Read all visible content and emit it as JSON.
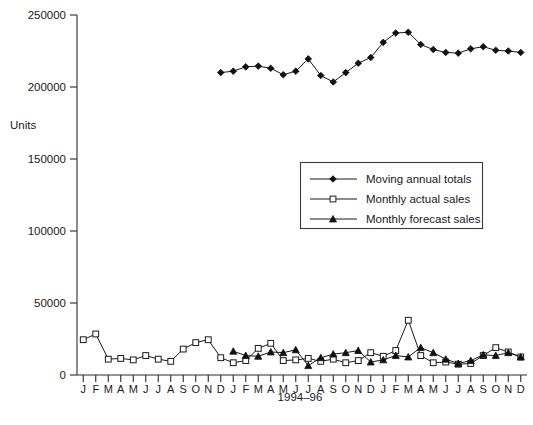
{
  "chart_data": {
    "type": "line",
    "title": "",
    "xlabel": "1994–96",
    "ylabel": "Units",
    "ylim": [
      0,
      250000
    ],
    "yticks": [
      0,
      50000,
      100000,
      150000,
      200000,
      250000
    ],
    "ytick_labels": [
      "0",
      "50000",
      "100000",
      "150000",
      "200000",
      "250000"
    ],
    "grid": false,
    "legend_position": "center-right",
    "categories": [
      "J",
      "F",
      "M",
      "A",
      "M",
      "J",
      "J",
      "A",
      "S",
      "O",
      "N",
      "D",
      "J",
      "F",
      "M",
      "A",
      "M",
      "J",
      "J",
      "A",
      "S",
      "O",
      "N",
      "D",
      "J",
      "F",
      "M",
      "A",
      "M",
      "J",
      "J",
      "A",
      "S",
      "O",
      "N",
      "D"
    ],
    "x_index": [
      1,
      2,
      3,
      4,
      5,
      6,
      7,
      8,
      9,
      10,
      11,
      12,
      13,
      14,
      15,
      16,
      17,
      18,
      19,
      20,
      21,
      22,
      23,
      24,
      25,
      26,
      27,
      28,
      29,
      30,
      31,
      32,
      33,
      34,
      35,
      36
    ],
    "series": [
      {
        "name": "Moving annual totals",
        "marker": "filled-diamond",
        "values": [
          null,
          null,
          null,
          null,
          null,
          null,
          null,
          null,
          null,
          null,
          null,
          210000,
          211000,
          214000,
          214500,
          213000,
          208500,
          211000,
          219500,
          208000,
          203500,
          210000,
          216500,
          220500,
          231000,
          237500,
          238000,
          229500,
          226000,
          224000,
          223500,
          226500,
          228000,
          225500,
          225000,
          224000
        ]
      },
      {
        "name": "Monthly actual sales",
        "marker": "open-square",
        "values": [
          24500,
          28500,
          11000,
          11500,
          10500,
          13500,
          11000,
          9500,
          18000,
          22500,
          24500,
          12000,
          8500,
          10000,
          18500,
          22000,
          10000,
          10500,
          11500,
          9500,
          11000,
          8500,
          10000,
          15500,
          13000,
          17000,
          38000,
          13500,
          8500,
          9000,
          7500,
          8000,
          13500,
          19000,
          16000,
          12500
        ]
      },
      {
        "name": "Monthly forecast sales",
        "marker": "filled-triangle",
        "values": [
          null,
          null,
          null,
          null,
          null,
          null,
          null,
          null,
          null,
          null,
          null,
          null,
          16500,
          13500,
          13000,
          16000,
          15500,
          17500,
          6500,
          12000,
          14500,
          15500,
          17000,
          9000,
          10500,
          13500,
          12500,
          19000,
          15500,
          11000,
          8000,
          10000,
          14000,
          13500,
          15500,
          12500
        ]
      }
    ]
  },
  "legend": {
    "items": [
      {
        "label": "Moving annual totals",
        "marker": "filled-diamond"
      },
      {
        "label": "Monthly actual sales",
        "marker": "open-square"
      },
      {
        "label": "Monthly forecast sales",
        "marker": "filled-triangle"
      }
    ]
  },
  "axes": {
    "y_title": "Units",
    "x_title": "1994–96"
  }
}
